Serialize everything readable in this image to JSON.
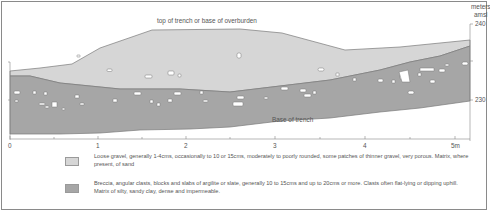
{
  "diagram": {
    "type": "geological-trench-section",
    "labels": {
      "top_surface": "top of trench or base of overburden",
      "base": "Base of trench"
    },
    "y_axis": {
      "unit_line1": "meters",
      "unit_line2": "amsl",
      "ticks": [
        "240",
        "230"
      ]
    },
    "x_axis": {
      "ticks": [
        "0",
        "1",
        "2",
        "3",
        "4",
        "5m"
      ]
    },
    "colors": {
      "loose_gravel": "#d6d6d6",
      "breccia": "#a6a6a6",
      "outline": "#7a7a7a",
      "clast": "#ffffff",
      "text": "#555555",
      "frame": "#8a8a8a"
    }
  },
  "legend": {
    "items": [
      {
        "name": "loose-gravel",
        "color": "#d6d6d6",
        "text": "Loose gravel, generally 1-4cms, occasionally to 10 or 15cms, moderately to poorly rounded, some patches of thinner gravel, very porous. Matrix, where present, of sand"
      },
      {
        "name": "breccia",
        "color": "#a6a6a6",
        "text": "Breccia, angular clasts, blocks and slabs of argilite or slate, generally 10 to 15cms and up to 20cms or more. Clasts often flat-lying or dipping uphill. Matrix of silty, sandy clay, dense and impermeable."
      }
    ]
  }
}
